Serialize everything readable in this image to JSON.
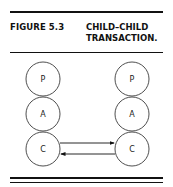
{
  "figure": {
    "label": "FIGURE 5.3",
    "title_line1": "CHILD–CHILD",
    "title_line2": "TRANSACTION."
  },
  "diagram": {
    "left_person": {
      "states": [
        "P",
        "A",
        "C"
      ]
    },
    "right_person": {
      "states": [
        "P",
        "A",
        "C"
      ]
    },
    "transactions": [
      {
        "from": "left.C",
        "to": "right.C",
        "direction": "right"
      },
      {
        "from": "right.C",
        "to": "left.C",
        "direction": "left"
      }
    ]
  }
}
